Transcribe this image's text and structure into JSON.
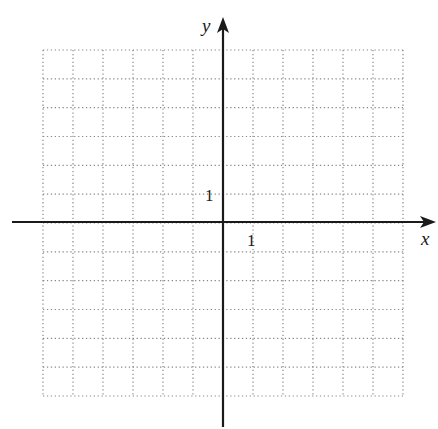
{
  "diagram": {
    "type": "cartesian-coordinate-grid",
    "x_axis_label": "x",
    "y_axis_label": "y",
    "x_unit_label": "1",
    "y_unit_label": "1",
    "top_cut_glyph": "y",
    "grid": {
      "columns": 12,
      "rows": 12,
      "x_range": [
        -6,
        6
      ],
      "y_range": [
        -6,
        6
      ],
      "line_style": "dotted"
    },
    "colors": {
      "axis": "#1a1a1a",
      "grid": "#8a8a8a",
      "background": "#ffffff"
    }
  }
}
